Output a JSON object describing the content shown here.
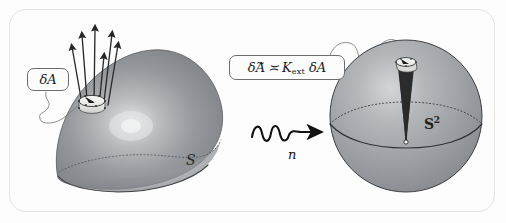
{
  "figure": {
    "width": 506,
    "height": 223,
    "background_color": "#fdfdfd",
    "frame_border_color": "#e2e2e2"
  },
  "labels": {
    "area_element": {
      "text": "δ𝒜",
      "delta": "δ",
      "symbol": "A"
    },
    "formula": {
      "full_text": "δ𝒜̃ ≍ 𝒦ext δ𝒜",
      "delta_left": "δ",
      "tilde_symbol": "A",
      "tilde_accent": "~",
      "relation": "≍",
      "curvature_symbol": "K",
      "curvature_subscript": "ext",
      "delta_right": "δ",
      "symbol_right": "A"
    },
    "surface": {
      "text": "S"
    },
    "sphere": {
      "base": "S",
      "exponent": "2"
    },
    "map": {
      "text": "n"
    }
  },
  "shapes": {
    "left_surface": {
      "name": "curved-surface",
      "fill_color": "#8f9296",
      "highlight_color": "#d9dadb",
      "outline_color": "#4a4d50"
    },
    "right_sphere": {
      "name": "unit-sphere",
      "fill_color": "#9a9da1",
      "highlight_color": "#cfd1d3",
      "outline_color": "#3c3f42"
    },
    "patch": {
      "name": "area-patch",
      "fill_color": "#f2f2f0",
      "outline_color": "#2b2b2b"
    },
    "normal_vectors": {
      "name": "normal-vector-arrows",
      "color": "#2a2a2a",
      "count_left": 6,
      "count_right": 6
    },
    "arrow": {
      "name": "squiggly-map-arrow",
      "color": "#111111",
      "direction": "right"
    },
    "leader_lines": {
      "color": "#6e6e6e"
    }
  },
  "colors": {
    "ink": "#1a1a1a",
    "gray_surface": "#8f9296",
    "gray_sphere": "#9a9da1",
    "frame": "#e2e2e2"
  }
}
